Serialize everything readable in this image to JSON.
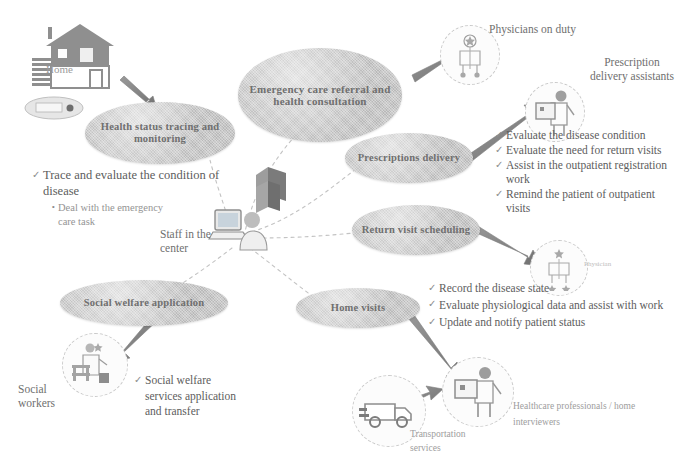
{
  "diagram": {
    "nodes": [
      {
        "id": "health-status",
        "label": "Health status tracing and monitoring"
      },
      {
        "id": "emergency-care",
        "label": "Emergency care referral and health consultation"
      },
      {
        "id": "prescriptions",
        "label": "Prescriptions delivery"
      },
      {
        "id": "return-visit",
        "label": "Return visit scheduling"
      },
      {
        "id": "home-visits",
        "label": "Home visits"
      },
      {
        "id": "social-welfare",
        "label": "Social welfare application"
      }
    ],
    "center": {
      "label": "Staff in the center",
      "icons": [
        "server-stack-icon",
        "person-at-computer-icon"
      ]
    },
    "actors": [
      {
        "id": "home",
        "label": "Home",
        "icon": "house-icon"
      },
      {
        "id": "physicians-on-duty",
        "label": "Physicians on duty",
        "icon": "doctor-icon"
      },
      {
        "id": "prescription-assist",
        "label": "Prescription delivery assistants",
        "icon": "delivery-assistant-icon"
      },
      {
        "id": "physician",
        "label": "Physician",
        "icon": "physician-icon"
      },
      {
        "id": "social-workers",
        "label": "Social workers",
        "icon": "social-worker-icon"
      },
      {
        "id": "transportation",
        "label": "Transportation services",
        "icon": "van-icon"
      },
      {
        "id": "home-interviewers",
        "label": "Healthcare professionals / home interviewers",
        "icon": "home-interviewer-icon"
      }
    ],
    "notes": [
      {
        "id": "note-health",
        "items": [
          {
            "type": "check",
            "text": "Trace and evaluate the condition of disease"
          },
          {
            "type": "bullet",
            "text": "Deal with the emergency care task"
          }
        ]
      },
      {
        "id": "note-prescription",
        "items": [
          {
            "type": "check",
            "text": "Evaluate the disease condition"
          },
          {
            "type": "check",
            "text": "Evaluate the need for return visits"
          },
          {
            "type": "check",
            "text": "Assist in the outpatient registration work"
          },
          {
            "type": "check",
            "text": "Remind the patient of outpatient visits"
          }
        ]
      },
      {
        "id": "note-homevisit",
        "items": [
          {
            "type": "check",
            "text": "Record the disease state"
          },
          {
            "type": "check",
            "text": "Evaluate physiological data and assist with work"
          },
          {
            "type": "check",
            "text": "Update and notify patient status"
          }
        ]
      },
      {
        "id": "note-welfare",
        "items": [
          {
            "type": "check",
            "text": "Social welfare services application and transfer"
          }
        ]
      }
    ],
    "marks": {
      "check": "✓",
      "bullet": "•"
    },
    "colors": {
      "node_fill": "#b9b9b9",
      "node_text": "#6f6f6f",
      "body_text": "#6b6b6b",
      "arrow": "#8a8a8a",
      "dashed_link": "#bcbcbc",
      "background": "#ffffff"
    }
  }
}
